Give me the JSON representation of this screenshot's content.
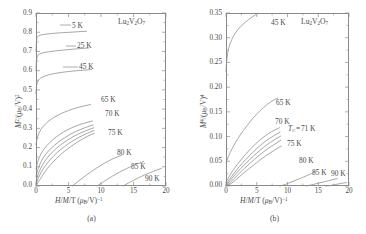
{
  "figure": {
    "material": "Lu2V2O7",
    "caption_a": "(a)",
    "caption_b": "(b)"
  },
  "panel_a": {
    "material_label": "Lu2V2O7",
    "ylabel": "M2/(muB/V)2",
    "xlabel": "H/M/T (muB/V)-1",
    "yticks": [
      "0.0",
      "0.1",
      "0.2",
      "0.3",
      "0.4",
      "0.5",
      "0.6",
      "0.7",
      "0.8",
      "0.9"
    ],
    "xticks": [
      "0",
      "5",
      "10",
      "15",
      "20"
    ],
    "curve_labels": [
      "5 K",
      "25 K",
      "45 K",
      "65 K",
      "70 K",
      "75 K",
      "80 K",
      "85 K",
      "90 K"
    ]
  },
  "panel_b": {
    "material_label": "Lu2V2O7",
    "ylabel": "M4/(muB/V)4",
    "xlabel": "H/M/T (muB/V)-1",
    "yticks": [
      "0.00",
      "0.05",
      "0.10",
      "0.15",
      "0.20",
      "0.25",
      "0.30",
      "0.35"
    ],
    "xticks": [
      "0",
      "5",
      "10",
      "15",
      "20"
    ],
    "curve_labels": [
      "45 K",
      "65 K",
      "70 K",
      "75 K",
      "80 K",
      "85 K",
      "90 K"
    ],
    "tc_annotation": "TC = 71 K"
  },
  "chart_data": [
    {
      "type": "line",
      "panel": "a",
      "title": "Arrott plot M^2 vs H/M for Lu2V2O7",
      "xlabel": "H/M / T (mu_B/V)^-1",
      "ylabel": "M^2 / (mu_B/V)^2",
      "xlim": [
        0,
        20
      ],
      "ylim": [
        0.0,
        0.9
      ],
      "grid": false,
      "legend": "inline curve labels",
      "annotation": "Lu2V2O7",
      "series": [
        {
          "name": "5 K",
          "x": [
            0.0,
            0.05,
            0.12,
            0.25,
            0.45,
            0.8,
            1.3,
            2.0,
            3.0,
            4.2,
            5.4,
            6.6,
            7.8
          ],
          "y": [
            0.7,
            0.745,
            0.768,
            0.778,
            0.783,
            0.786,
            0.789,
            0.792,
            0.795,
            0.798,
            0.8,
            0.803,
            0.805
          ]
        },
        {
          "name": "25 K",
          "x": [
            0.0,
            0.06,
            0.15,
            0.3,
            0.55,
            0.95,
            1.5,
            2.3,
            3.3,
            4.5,
            5.7,
            6.9,
            8.1
          ],
          "y": [
            0.6,
            0.65,
            0.672,
            0.682,
            0.688,
            0.692,
            0.696,
            0.7,
            0.704,
            0.708,
            0.712,
            0.715,
            0.718
          ]
        },
        {
          "name": "45 K",
          "x": [
            0.0,
            0.08,
            0.2,
            0.4,
            0.7,
            1.2,
            1.9,
            2.8,
            3.9,
            5.1,
            6.3,
            7.5,
            8.6
          ],
          "y": [
            0.48,
            0.52,
            0.54,
            0.552,
            0.562,
            0.57,
            0.578,
            0.585,
            0.591,
            0.596,
            0.6,
            0.603,
            0.606
          ]
        },
        {
          "name": "65 K",
          "x": [
            0.0,
            0.15,
            0.4,
            0.8,
            1.4,
            2.2,
            3.2,
            4.4,
            5.6,
            6.8,
            7.9,
            8.4
          ],
          "y": [
            0.215,
            0.245,
            0.272,
            0.298,
            0.322,
            0.345,
            0.366,
            0.385,
            0.4,
            0.412,
            0.42,
            0.424
          ]
        },
        {
          "name": "70 K",
          "x": [
            0.0,
            0.2,
            0.5,
            1.0,
            1.7,
            2.6,
            3.6,
            4.8,
            6.0,
            7.2,
            8.2,
            8.7
          ],
          "y": [
            0.09,
            0.118,
            0.15,
            0.182,
            0.212,
            0.242,
            0.268,
            0.292,
            0.311,
            0.325,
            0.334,
            0.338
          ]
        },
        {
          "name": "71 K",
          "x": [
            0.0,
            0.25,
            0.6,
            1.15,
            1.9,
            2.8,
            3.9,
            5.1,
            6.3,
            7.5,
            8.4,
            8.8
          ],
          "y": [
            0.05,
            0.082,
            0.115,
            0.15,
            0.182,
            0.212,
            0.24,
            0.266,
            0.287,
            0.303,
            0.314,
            0.318
          ]
        },
        {
          "name": "72 K",
          "x": [
            0.0,
            0.3,
            0.7,
            1.3,
            2.1,
            3.0,
            4.1,
            5.3,
            6.5,
            7.7,
            8.5,
            8.9
          ],
          "y": [
            0.025,
            0.058,
            0.092,
            0.128,
            0.162,
            0.193,
            0.222,
            0.249,
            0.271,
            0.288,
            0.298,
            0.303
          ]
        },
        {
          "name": "73 K",
          "x": [
            0.0,
            0.35,
            0.8,
            1.45,
            2.3,
            3.25,
            4.35,
            5.55,
            6.75,
            7.85,
            8.6,
            8.95
          ],
          "y": [
            0.01,
            0.04,
            0.073,
            0.108,
            0.142,
            0.175,
            0.205,
            0.233,
            0.256,
            0.274,
            0.284,
            0.289
          ]
        },
        {
          "name": "75 K",
          "x": [
            0.0,
            0.45,
            1.0,
            1.7,
            2.6,
            3.6,
            4.7,
            5.9,
            7.0,
            8.0,
            8.7,
            9.0
          ],
          "y": [
            0.0,
            0.025,
            0.055,
            0.09,
            0.125,
            0.158,
            0.19,
            0.218,
            0.242,
            0.26,
            0.27,
            0.274
          ]
        },
        {
          "name": "80 K",
          "x": [
            5.6,
            6.4,
            7.4,
            8.5,
            9.6,
            10.7,
            11.7,
            12.6,
            13.2
          ],
          "y": [
            0.0,
            0.022,
            0.048,
            0.075,
            0.1,
            0.122,
            0.14,
            0.153,
            0.16
          ]
        },
        {
          "name": "85 K",
          "x": [
            9.4,
            10.2,
            11.2,
            12.3,
            13.4,
            14.5,
            15.4,
            16.1,
            16.6
          ],
          "y": [
            0.0,
            0.018,
            0.04,
            0.062,
            0.082,
            0.1,
            0.113,
            0.122,
            0.128
          ]
        },
        {
          "name": "90 K",
          "x": [
            13.4,
            14.2,
            15.2,
            16.2,
            17.2,
            18.1,
            18.8,
            19.3
          ],
          "y": [
            0.0,
            0.015,
            0.033,
            0.05,
            0.065,
            0.077,
            0.086,
            0.092
          ]
        }
      ]
    },
    {
      "type": "line",
      "panel": "b",
      "title": "Arrott plot M^4 vs H/M for Lu2V2O7",
      "xlabel": "H/M / T (mu_B/V)^-1",
      "ylabel": "M^4 / (mu_B/V)^4",
      "xlim": [
        0,
        20
      ],
      "ylim": [
        0.0,
        0.35
      ],
      "grid": false,
      "legend": "inline curve labels",
      "annotation": "Lu2V2O7",
      "tc": "TC = 71 K",
      "series": [
        {
          "name": "45 K",
          "x": [
            0.0,
            0.1,
            0.25,
            0.5,
            0.9,
            1.5,
            2.3,
            3.2,
            4.2,
            5.2,
            6.0,
            6.6
          ],
          "y": [
            0.232,
            0.252,
            0.268,
            0.282,
            0.296,
            0.31,
            0.322,
            0.332,
            0.342,
            0.35,
            0.355,
            0.358
          ]
        },
        {
          "name": "65 K",
          "x": [
            0.0,
            0.4,
            1.0,
            1.8,
            2.8,
            3.9,
            5.0,
            6.1,
            7.1,
            7.9,
            8.4
          ],
          "y": [
            0.047,
            0.06,
            0.076,
            0.094,
            0.112,
            0.13,
            0.146,
            0.159,
            0.169,
            0.175,
            0.178
          ]
        },
        {
          "name": "70 K",
          "x": [
            0.0,
            0.5,
            1.2,
            2.1,
            3.1,
            4.2,
            5.3,
            6.4,
            7.4,
            8.2,
            8.7
          ],
          "y": [
            0.008,
            0.019,
            0.033,
            0.048,
            0.063,
            0.078,
            0.091,
            0.102,
            0.11,
            0.115,
            0.118
          ]
        },
        {
          "name": "71 K",
          "x": [
            0.0,
            0.55,
            1.3,
            2.2,
            3.25,
            4.35,
            5.45,
            6.55,
            7.55,
            8.35,
            8.8
          ],
          "y": [
            0.003,
            0.013,
            0.026,
            0.04,
            0.054,
            0.068,
            0.081,
            0.092,
            0.1,
            0.106,
            0.109
          ]
        },
        {
          "name": "72 K",
          "x": [
            0.0,
            0.6,
            1.4,
            2.35,
            3.4,
            4.5,
            5.6,
            6.7,
            7.7,
            8.45,
            8.9
          ],
          "y": [
            0.001,
            0.01,
            0.022,
            0.035,
            0.048,
            0.061,
            0.073,
            0.084,
            0.092,
            0.098,
            0.101
          ]
        },
        {
          "name": "73 K",
          "x": [
            0.0,
            0.7,
            1.55,
            2.5,
            3.55,
            4.65,
            5.75,
            6.85,
            7.85,
            8.55,
            8.95
          ],
          "y": [
            0.0,
            0.007,
            0.018,
            0.03,
            0.042,
            0.054,
            0.066,
            0.076,
            0.084,
            0.09,
            0.093
          ]
        },
        {
          "name": "75 K",
          "x": [
            0.0,
            0.85,
            1.75,
            2.75,
            3.85,
            4.95,
            6.0,
            7.05,
            7.95,
            8.6,
            9.0
          ],
          "y": [
            0.0,
            0.005,
            0.014,
            0.025,
            0.036,
            0.047,
            0.057,
            0.066,
            0.073,
            0.078,
            0.081
          ]
        },
        {
          "name": "80 K",
          "x": [
            8.8,
            9.6,
            10.6,
            11.6,
            12.6,
            13.5,
            14.2,
            14.7
          ],
          "y": [
            0.0,
            0.003,
            0.008,
            0.013,
            0.018,
            0.023,
            0.027,
            0.029
          ]
        },
        {
          "name": "85 K",
          "x": [
            13.0,
            13.8,
            14.8,
            15.8,
            16.7,
            17.5,
            18.1
          ],
          "y": [
            0.0,
            0.002,
            0.005,
            0.008,
            0.011,
            0.013,
            0.015
          ]
        },
        {
          "name": "90 K",
          "x": [
            16.2,
            17.0,
            17.8,
            18.6,
            19.2,
            19.6
          ],
          "y": [
            0.0,
            0.001,
            0.003,
            0.005,
            0.006,
            0.007
          ]
        }
      ]
    }
  ]
}
